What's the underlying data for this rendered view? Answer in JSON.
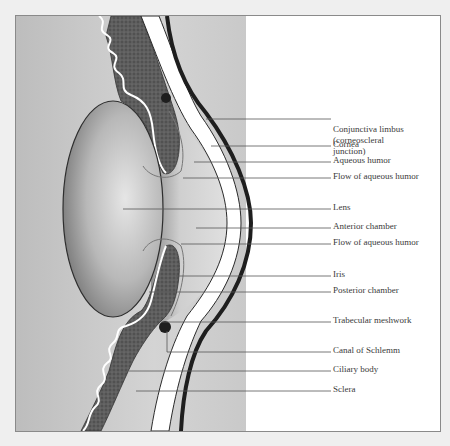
{
  "diagram": {
    "colors": {
      "background": "#efefef",
      "frame_border": "#8a8a8a",
      "label_text": "#3a3a3a",
      "leader_line": "#555555",
      "vitreous_gray": "#c8c8c8",
      "lens_gray": "#bcbcbc",
      "iris_ciliary_dark": "#5a5a5a",
      "sclera_white": "#ffffff",
      "conjunctiva_black": "#222222"
    },
    "labels": [
      {
        "id": "conjunctiva-limbus",
        "lines": [
          "Conjunctiva limbus",
          "(corneoscleral",
          "junction)"
        ],
        "y": 129
      },
      {
        "id": "cornea",
        "lines": [
          "Cornea"
        ],
        "y": 145
      },
      {
        "id": "aqueous-humor",
        "lines": [
          "Aqueous humor"
        ],
        "y": 161
      },
      {
        "id": "flow-of-aqueous-humor-upper",
        "lines": [
          "Flow of aqueous humor"
        ],
        "y": 177
      },
      {
        "id": "lens",
        "lines": [
          "Lens"
        ],
        "y": 208
      },
      {
        "id": "anterior-chamber",
        "lines": [
          "Anterior chamber"
        ],
        "y": 227
      },
      {
        "id": "flow-of-aqueous-humor-lower",
        "lines": [
          "Flow of aqueous humor"
        ],
        "y": 243
      },
      {
        "id": "iris",
        "lines": [
          "Iris"
        ],
        "y": 275
      },
      {
        "id": "posterior-chamber",
        "lines": [
          "Posterior chamber"
        ],
        "y": 291
      },
      {
        "id": "trabecular-meshwork",
        "lines": [
          "Trabecular meshwork"
        ],
        "y": 321
      },
      {
        "id": "canal-of-schlemm",
        "lines": [
          "Canal of Schlemm"
        ],
        "y": 351
      },
      {
        "id": "ciliary-body",
        "lines": [
          "Ciliary body"
        ],
        "y": 370
      },
      {
        "id": "sclera",
        "lines": [
          "Sclera"
        ],
        "y": 390
      }
    ]
  },
  "labels": {
    "conjunctiva_1": "Conjunctiva limbus",
    "conjunctiva_2": "(corneoscleral",
    "conjunctiva_3": "junction)",
    "cornea": "Cornea",
    "aqueous_humor": "Aqueous humor",
    "flow_upper": "Flow of aqueous humor",
    "lens": "Lens",
    "anterior_chamber": "Anterior chamber",
    "flow_lower": "Flow of aqueous humor",
    "iris": "Iris",
    "posterior_chamber": "Posterior chamber",
    "trabecular_meshwork": "Trabecular meshwork",
    "canal_of_schlemm": "Canal of Schlemm",
    "ciliary_body": "Ciliary body",
    "sclera": "Sclera"
  }
}
